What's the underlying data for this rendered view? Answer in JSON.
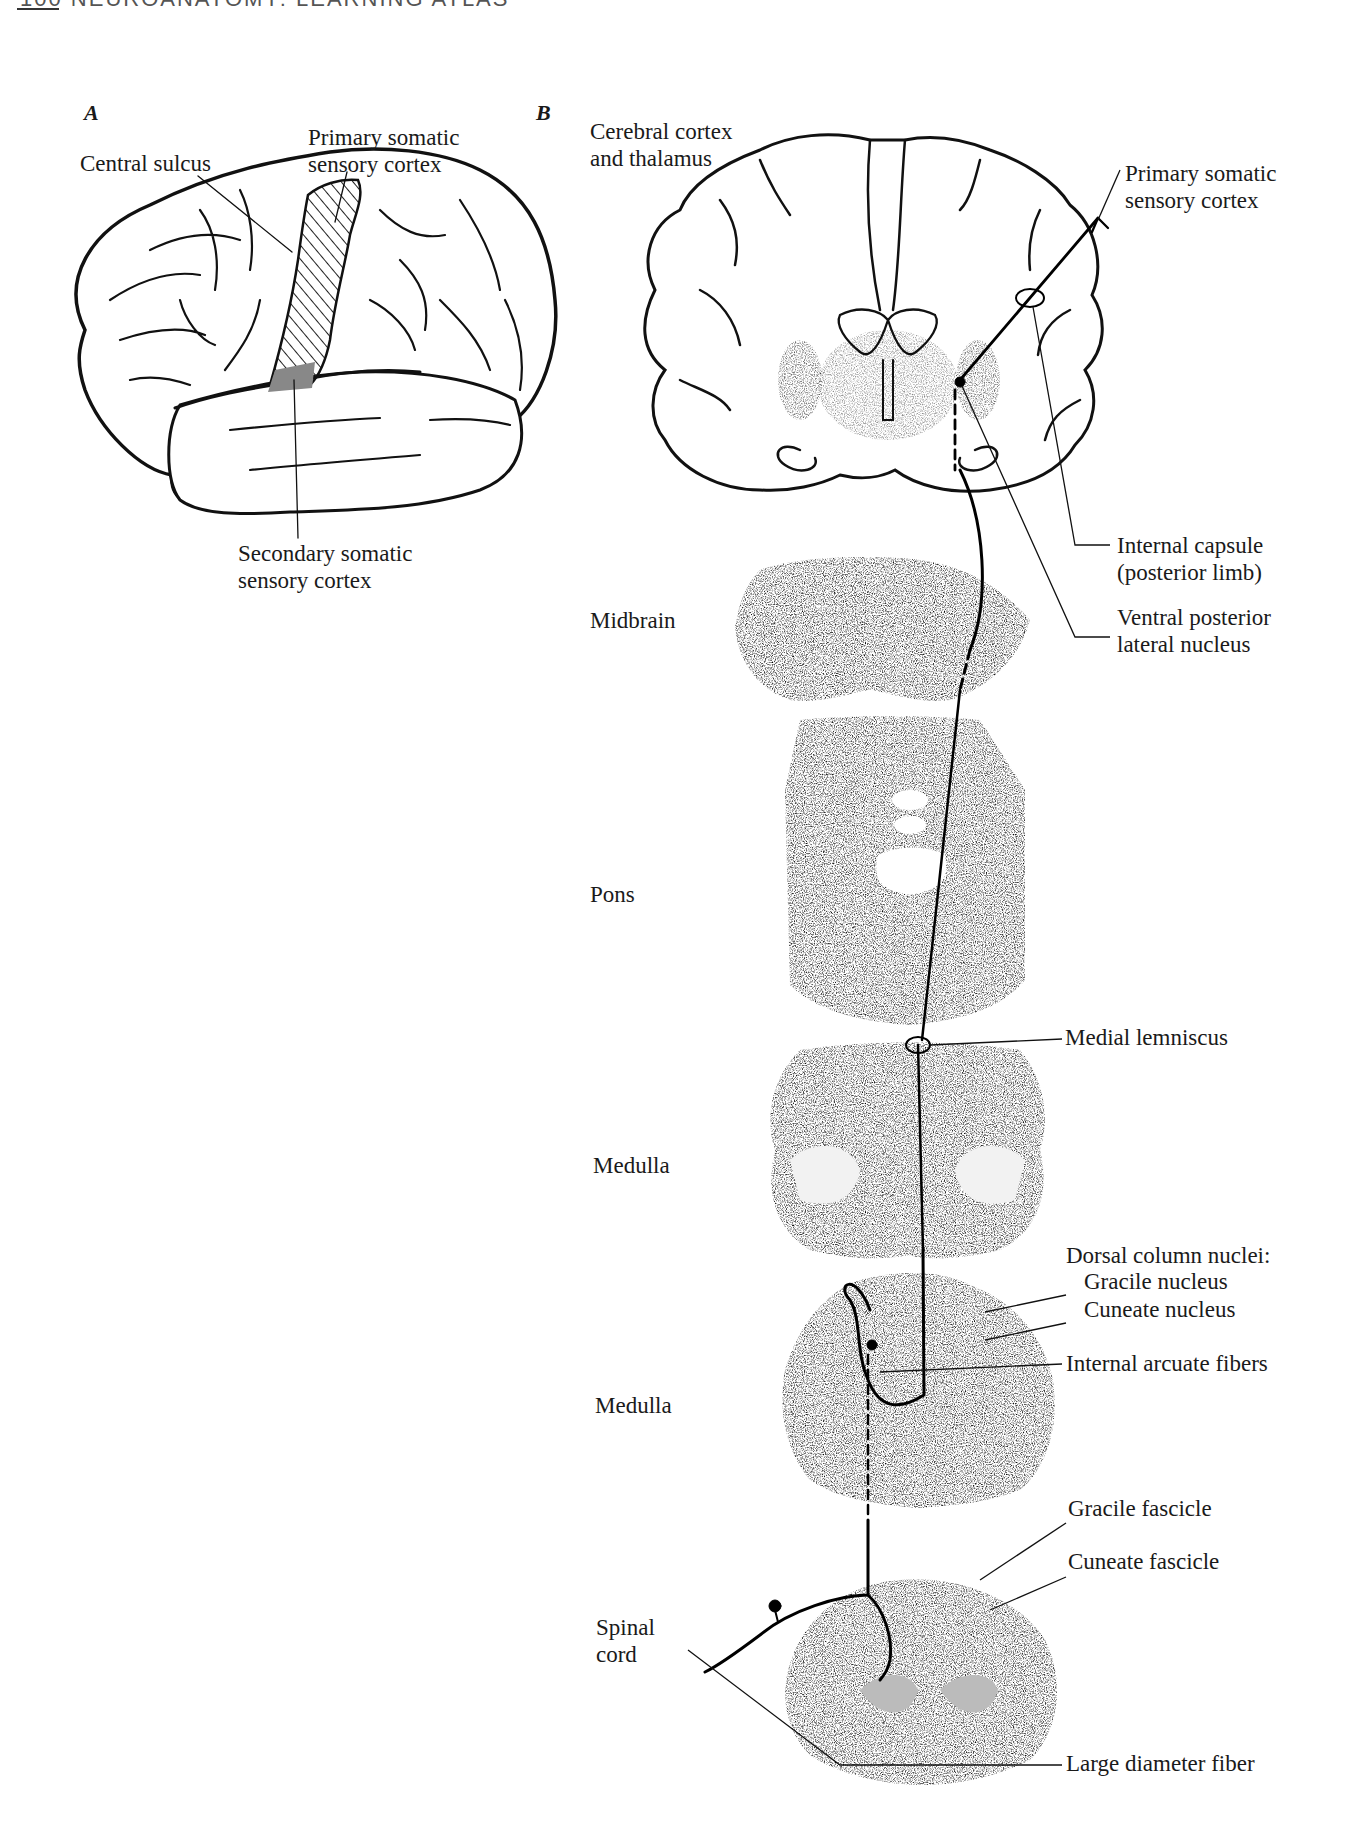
{
  "page": {
    "running_head": "100 NEUROANATOMY: LEARNING ATLAS"
  },
  "panel_a": {
    "letter": "A",
    "labels": {
      "central_sulcus": "Central sulcus",
      "primary_somatic_line1": "Primary somatic",
      "primary_somatic_line2": "sensory cortex",
      "secondary_somatic_line1": "Secondary somatic",
      "secondary_somatic_line2": "sensory cortex"
    }
  },
  "panel_b": {
    "letter": "B",
    "levels": {
      "cortex_line1": "Cerebral cortex",
      "cortex_line2": "and thalamus",
      "midbrain": "Midbrain",
      "pons": "Pons",
      "medulla_upper": "Medulla",
      "medulla_lower": "Medulla",
      "spinal_line1": "Spinal",
      "spinal_line2": "cord"
    },
    "labels": {
      "primary_somatic_line1": "Primary somatic",
      "primary_somatic_line2": "sensory cortex",
      "internal_capsule_line1": "Internal capsule",
      "internal_capsule_line2": "(posterior limb)",
      "vpl_line1": "Ventral posterior",
      "vpl_line2": "lateral nucleus",
      "medial_lemniscus": "Medial lemniscus",
      "dorsal_column_nuclei": "Dorsal column nuclei:",
      "gracile_nucleus": "Gracile nucleus",
      "cuneate_nucleus": "Cuneate nucleus",
      "internal_arcuate_fibers": "Internal arcuate fibers",
      "gracile_fascicle": "Gracile fascicle",
      "cuneate_fascicle": "Cuneate fascicle",
      "large_diameter_fiber": "Large diameter fiber"
    }
  }
}
